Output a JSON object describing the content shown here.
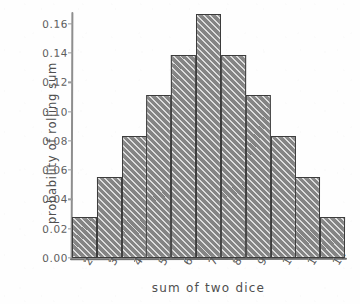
{
  "chart_data": {
    "type": "bar",
    "title": "",
    "xlabel": "sum of two dice",
    "ylabel": "probability of rolling sum",
    "categories": [
      "2",
      "3",
      "4",
      "5",
      "6",
      "7",
      "8",
      "9",
      "10",
      "11",
      "12"
    ],
    "values": [
      0.0278,
      0.0556,
      0.0833,
      0.1111,
      0.1389,
      0.1667,
      0.1389,
      0.1111,
      0.0833,
      0.0556,
      0.0278
    ],
    "ylim": [
      0.0,
      0.1667
    ],
    "xlim": [
      1.5,
      12.5
    ],
    "yticks": [
      0.0,
      0.02,
      0.04,
      0.06,
      0.08,
      0.1,
      0.12,
      0.14,
      0.16
    ],
    "ytick_labels": [
      "0.00",
      "0.02",
      "0.04",
      "0.06",
      "0.08",
      "0.10",
      "0.12",
      "0.14",
      "0.16"
    ],
    "grid": false,
    "legend": false,
    "legend_position": "none",
    "style": "hand-drawn",
    "bar_fill": "#a3a3a3",
    "bar_hatch": "diagonal",
    "bar_edge_color": "#3c3c3c",
    "axis_color": "#6f6f6f",
    "background": "#fefefe"
  }
}
